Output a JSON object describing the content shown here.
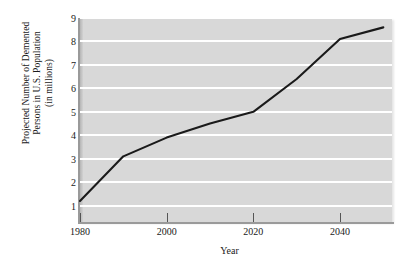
{
  "chart_data": {
    "type": "line",
    "title": "",
    "xlabel": "Year",
    "ylabel": "Projected Number of Demented Persons in U.S. Population (in millions)",
    "ylabel_lines": [
      "Projected Number of Demented",
      "Persons in U.S. Population",
      "(in millions)"
    ],
    "x": [
      1980,
      1990,
      2000,
      2010,
      2020,
      2030,
      2040,
      2050
    ],
    "values": [
      1.2,
      3.1,
      3.9,
      4.5,
      5.0,
      6.4,
      8.1,
      8.6
    ],
    "series": [
      {
        "name": "Projected demented persons",
        "values": [
          1.2,
          3.1,
          3.9,
          4.5,
          5.0,
          6.4,
          8.1,
          8.6
        ]
      }
    ],
    "xlim": [
      1980,
      2052
    ],
    "ylim": [
      0.3,
      9.0
    ],
    "xticks": [
      1980,
      2000,
      2020,
      2040
    ],
    "xtick_labels": [
      "1980",
      "2000",
      "2020",
      "2040"
    ],
    "yticks": [
      1,
      2,
      3,
      4,
      5,
      6,
      7,
      8,
      9
    ],
    "ytick_labels": [
      "1",
      "2",
      "3",
      "4",
      "5",
      "6",
      "7",
      "8",
      "9"
    ],
    "grid": "horizontal-white",
    "legend": "none",
    "plot_background": "#d8d8d8",
    "gridline_color": "#ffffff",
    "line_color": "#1a1a1a",
    "figure_background": "#ffffff"
  }
}
